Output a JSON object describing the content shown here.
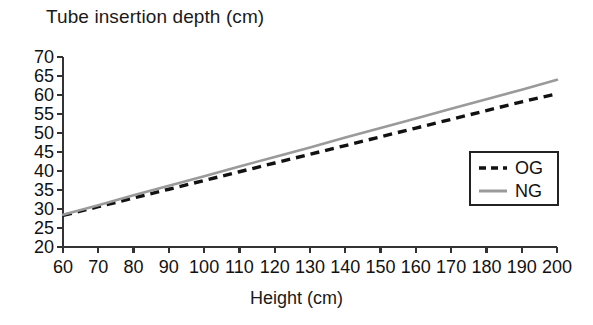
{
  "chart_data": {
    "type": "line",
    "title": "Tube insertion depth (cm)",
    "xlabel": "Height (cm)",
    "ylabel": "Tube insertion depth (cm)",
    "xlim": [
      60,
      200
    ],
    "ylim": [
      20,
      70
    ],
    "xticks": [
      60,
      70,
      80,
      90,
      100,
      110,
      120,
      130,
      140,
      150,
      160,
      170,
      180,
      190,
      200
    ],
    "yticks": [
      20,
      25,
      30,
      35,
      40,
      45,
      50,
      55,
      60,
      65,
      70
    ],
    "xtick_labels": [
      "60",
      "70",
      "80",
      "90",
      "100",
      "110",
      "120",
      "130",
      "140",
      "150",
      "160",
      "170",
      "180",
      "190",
      "200"
    ],
    "ytick_labels": [
      "20",
      "25",
      "30",
      "35",
      "40",
      "45",
      "50",
      "55",
      "60",
      "65",
      "70"
    ],
    "grid": false,
    "legend_position": "center-right",
    "x": [
      60,
      70,
      80,
      90,
      100,
      110,
      120,
      130,
      140,
      150,
      160,
      170,
      180,
      190,
      200
    ],
    "series": [
      {
        "name": "OG",
        "style": "dashed",
        "color": "#111111",
        "values": [
          28.3,
          30.6,
          32.9,
          35.2,
          37.5,
          39.8,
          42.1,
          44.4,
          46.7,
          49.0,
          51.3,
          53.6,
          55.9,
          58.2,
          60.3
        ]
      },
      {
        "name": "NG",
        "style": "solid",
        "color": "#9a9a9a",
        "values": [
          28.5,
          31.0,
          33.6,
          36.1,
          38.6,
          41.2,
          43.7,
          46.2,
          48.8,
          51.3,
          53.8,
          56.4,
          58.9,
          61.4,
          64.0
        ]
      }
    ]
  },
  "legend": {
    "items": [
      {
        "label": "OG"
      },
      {
        "label": "NG"
      }
    ]
  },
  "colors": {
    "og_line": "#111111",
    "ng_line": "#9a9a9a",
    "axis": "#333333",
    "background": "#ffffff"
  }
}
